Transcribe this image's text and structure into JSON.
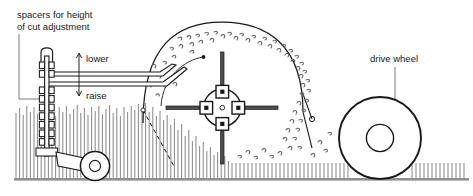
{
  "diagram": {
    "labels": {
      "spacers_line1": "spacers for height",
      "spacers_line2": "of cut adjustment",
      "lower": "lower",
      "raise": "raise",
      "drive_wheel": "drive wheel"
    },
    "colors": {
      "stroke": "#1a1a1a",
      "grass": "#8c8c8c",
      "ground": "#8f8f8f",
      "blade_fill": "#4d4d4d",
      "clipping": "#6e6e6e",
      "leader": "#6b6b6b",
      "background": "#ffffff"
    },
    "parts": {
      "spacer_stack": {
        "name": "spacers",
        "count": 8
      },
      "adjust_arrow": {
        "name": "height-adjust-arrow",
        "directions": [
          "up",
          "down"
        ]
      },
      "blade_hub": {
        "name": "rotary-blade-hub",
        "blades": 4,
        "bolts": 4
      },
      "housing": {
        "name": "mower-deck-housing"
      },
      "drive_wheel": {
        "name": "drive-wheel",
        "has_hub": true
      },
      "caster_wheel": {
        "name": "front-caster-wheel",
        "has_hub": true
      },
      "clippings": {
        "name": "grass-clippings"
      },
      "grass_uncut": {
        "name": "uncut-grass"
      },
      "grass_cut": {
        "name": "cut-grass"
      },
      "cut_line": {
        "name": "cut-height-dashed-line",
        "style": "dashed"
      },
      "ground": {
        "name": "ground-line"
      }
    }
  }
}
